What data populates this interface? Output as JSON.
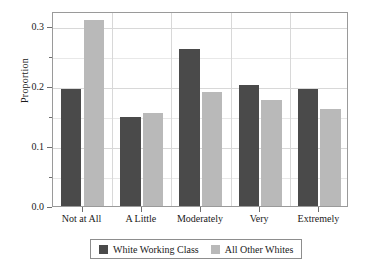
{
  "chart_data": {
    "type": "bar",
    "title": "",
    "xlabel": "",
    "ylabel": "Proportion",
    "categories": [
      "Not at All",
      "A Little",
      "Moderately",
      "Very",
      "Extremely"
    ],
    "series": [
      {
        "name": "White Working Class",
        "color": "#4a4a4a",
        "values": [
          0.195,
          0.148,
          0.262,
          0.201,
          0.195
        ]
      },
      {
        "name": "All Other Whites",
        "color": "#b9b9b9",
        "values": [
          0.31,
          0.155,
          0.19,
          0.176,
          0.162
        ]
      }
    ],
    "ylim": [
      0.0,
      0.325
    ],
    "yticks": [
      "0.0",
      "0.1",
      "0.2",
      "0.3"
    ],
    "ytick_values": [
      0.0,
      0.1,
      0.2,
      0.3
    ],
    "yminor_values": [
      0.05,
      0.15,
      0.25
    ],
    "grid": true,
    "legend_position": "bottom"
  },
  "legend": {
    "entries": [
      {
        "label": "White Working Class",
        "color": "#4a4a4a"
      },
      {
        "label": "All Other Whites",
        "color": "#b9b9b9"
      }
    ]
  },
  "colors": {
    "series_dark": "#4a4a4a",
    "series_light": "#b9b9b9",
    "frame": "#9a9a9a",
    "grid_major": "#d8d8d8",
    "grid_minor": "#e8e8e8",
    "text": "#1a1a1a",
    "background": "#ffffff"
  }
}
